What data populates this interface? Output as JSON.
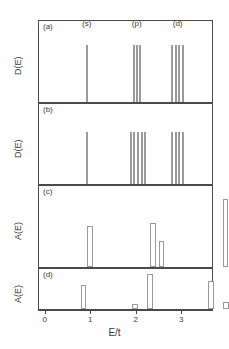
{
  "figure": {
    "xlabel": "E/t",
    "xticks": [
      "0",
      "1",
      "2",
      "3"
    ],
    "xtick_values": [
      0,
      1,
      2,
      3
    ],
    "xlim": [
      -0.15,
      3.7
    ]
  },
  "chart_data": {
    "type": "bar",
    "title": "",
    "xlabel": "E/t",
    "ylabel": "D(E) / A(E)",
    "xlim": [
      -0.15,
      3.7
    ],
    "grid": false,
    "legend": false,
    "panels": [
      {
        "id": "a",
        "label": "(a)",
        "ylabel": "D(E)",
        "ylim": [
          0,
          1
        ],
        "annotations": [
          {
            "text": "(s)",
            "x": 0.9,
            "y": 0.93
          },
          {
            "text": "(p)",
            "x": 2.0,
            "y": 0.93
          },
          {
            "text": "(d)",
            "x": 2.9,
            "y": 0.93
          }
        ],
        "x": [
          0.9,
          1.93,
          2.0,
          2.07,
          2.78,
          2.86,
          2.94,
          3.02
        ],
        "values": [
          0.72,
          0.72,
          0.72,
          0.72,
          0.72,
          0.72,
          0.72,
          0.72
        ],
        "bar_width": 0.045
      },
      {
        "id": "b",
        "label": "(b)",
        "ylabel": "D(E)",
        "ylim": [
          0,
          1
        ],
        "annotations": [],
        "x": [
          0.9,
          1.87,
          1.95,
          2.03,
          2.11,
          2.19,
          2.78,
          2.86,
          2.94,
          3.02
        ],
        "values": [
          0.66,
          0.66,
          0.66,
          0.66,
          0.66,
          0.66,
          0.66,
          0.66,
          0.66,
          0.66
        ],
        "bar_width": 0.045
      },
      {
        "id": "c",
        "label": "(c)",
        "ylabel": "A(E)",
        "ylim": [
          0,
          1
        ],
        "annotations": [],
        "x": [
          0.97,
          2.36,
          2.55,
          3.95
        ],
        "values": [
          0.52,
          0.56,
          0.33,
          0.86
        ],
        "bar_width": 0.12
      },
      {
        "id": "d",
        "label": "(d)",
        "ylabel": "A(E)",
        "ylim": [
          0,
          1
        ],
        "annotations": [],
        "x": [
          0.83,
          1.97,
          2.3,
          3.63,
          3.96
        ],
        "values": [
          0.62,
          0.12,
          0.9,
          0.72,
          0.17
        ],
        "bar_width": 0.13
      }
    ]
  },
  "colors": {
    "frame": "#4a4a4a",
    "bar_outline": "#9a9a9a",
    "text": "#3a3a3a",
    "background": "#ffffff"
  }
}
